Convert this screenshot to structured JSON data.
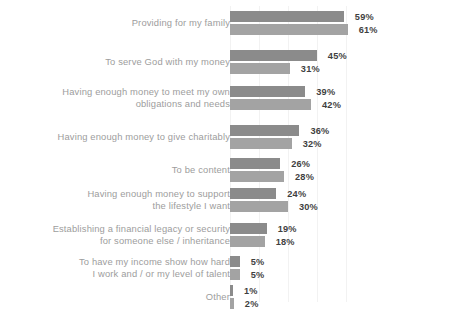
{
  "chart_data": {
    "type": "bar",
    "orientation": "horizontal",
    "title": "",
    "subtitle": "",
    "xlabel": "",
    "ylabel": "",
    "xlim": [
      0,
      65
    ],
    "grid": true,
    "legend_position": "none",
    "value_suffix": "%",
    "categories": [
      "Providing for my family",
      "To serve God with my money",
      "Having enough money to meet my own\nobligations and needs",
      "Having enough money to give charitably",
      "To be content",
      "Having enough money to support\nthe lifestyle I want",
      "Establishing a financial legacy or security\nfor someone else / inheritance",
      "To have my income show how hard\nI work and / or my level of talent",
      "Other"
    ],
    "series": [
      {
        "name": "Series 1",
        "color": "#8b8b8b",
        "values": [
          59,
          45,
          39,
          36,
          26,
          24,
          19,
          5,
          1
        ],
        "labels": [
          "59%",
          "45%",
          "39%",
          "36%",
          "26%",
          "24%",
          "19%",
          "5%",
          "1%"
        ]
      },
      {
        "name": "Series 2",
        "color": "#a3a3a3",
        "values": [
          61,
          31,
          42,
          32,
          28,
          30,
          18,
          5,
          2
        ],
        "labels": [
          "61%",
          "31%",
          "42%",
          "32%",
          "28%",
          "30%",
          "18%",
          "5%",
          "2%"
        ]
      }
    ],
    "gridline_values": [
      0,
      15,
      30,
      45,
      60
    ],
    "colors": {
      "series_1": "#8b8b8b",
      "series_2": "#a3a3a3",
      "category_label": "#9d9d9d",
      "value_label": "#3f3f3f",
      "gridline": "#f2f2f2",
      "background": "#ffffff"
    }
  }
}
